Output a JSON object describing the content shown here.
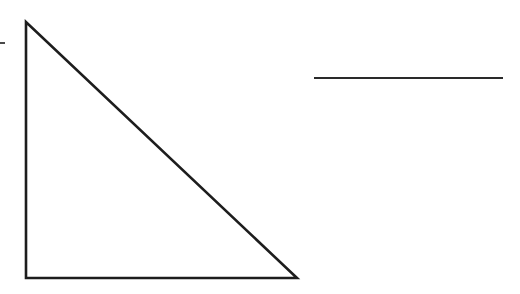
{
  "figure": {
    "canvas": {
      "width": 520,
      "height": 294,
      "background": "#ffffff"
    },
    "title": "Right triangle and horizontal line segment",
    "stroke_color": "#1d1d1d",
    "fill_color": "none",
    "shapes": [
      {
        "id": "right-triangle",
        "name": "right-triangle",
        "type": "polygon",
        "label": "Right triangle",
        "stroke": "#1d1d1d",
        "stroke_width": 2.6,
        "fill": "none",
        "vertices": [
          {
            "name": "apex",
            "x": 26,
            "y": 22
          },
          {
            "name": "right-angle-corner",
            "x": 26,
            "y": 278
          },
          {
            "name": "bottom-right",
            "x": 297,
            "y": 278
          }
        ],
        "edges": [
          {
            "name": "vertical-leg",
            "from": "apex",
            "to": "right-angle-corner",
            "length_px": 256
          },
          {
            "name": "horizontal-leg",
            "from": "right-angle-corner",
            "to": "bottom-right",
            "length_px": 271
          },
          {
            "name": "hypotenuse",
            "from": "bottom-right",
            "to": "apex",
            "length_px": 372
          }
        ]
      },
      {
        "id": "horizontal-segment",
        "name": "horizontal-line-segment",
        "type": "line",
        "label": "Horizontal line segment",
        "stroke": "#2a2a2a",
        "stroke_width": 2.0,
        "x1": 314,
        "y1": 78,
        "x2": 503,
        "y2": 78,
        "length_px": 189
      },
      {
        "id": "edge-tick",
        "name": "left-edge-tick-mark",
        "type": "line",
        "label": "Small tick mark at left edge",
        "stroke": "#4a4a4a",
        "stroke_width": 2.0,
        "x1": 0,
        "y1": 43,
        "x2": 5,
        "y2": 43,
        "length_px": 5
      }
    ]
  }
}
